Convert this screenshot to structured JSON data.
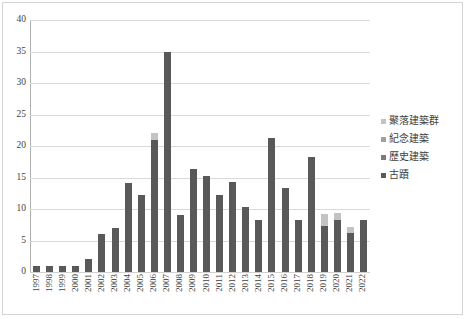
{
  "chart_data": {
    "type": "bar",
    "title": "",
    "subtitle": "",
    "xlabel": "",
    "ylabel": "",
    "ylim": [
      0,
      40
    ],
    "ytick_step": 5,
    "yticks": [
      "0",
      "5",
      "10",
      "15",
      "20",
      "25",
      "30",
      "35",
      "40"
    ],
    "grid": true,
    "stacked": true,
    "legend_position": "right",
    "categories": [
      "1997",
      "1998",
      "1999",
      "2000",
      "2001",
      "2002",
      "2003",
      "2004",
      "2005",
      "2006",
      "2007",
      "2008",
      "2009",
      "2010",
      "2011",
      "2012",
      "2013",
      "2014",
      "2015",
      "2016",
      "2017",
      "2018",
      "2019",
      "2020",
      "2021",
      "2022"
    ],
    "series": [
      {
        "name": "古蹟",
        "color": "#595959",
        "values": [
          1,
          1,
          1,
          1,
          2,
          6,
          7,
          14.2,
          12.2,
          21,
          35,
          9,
          16.3,
          15.3,
          12.3,
          14.3,
          10.3,
          8.3,
          21.3,
          13.3,
          8.3,
          18.3,
          7.3,
          8.3,
          6.2,
          8.3
        ]
      },
      {
        "name": "歷史建築",
        "color": "#7a7a7a",
        "values": [
          0,
          0,
          0,
          0,
          0,
          0,
          0,
          0,
          0,
          0,
          0,
          0,
          0,
          0,
          0,
          0,
          0,
          0,
          0,
          0,
          0,
          0,
          0,
          0,
          0,
          0
        ]
      },
      {
        "name": "紀念建築",
        "color": "#a0a0a0",
        "values": [
          0,
          0,
          0,
          0,
          0,
          0,
          0,
          0,
          0,
          0,
          0,
          0,
          0,
          0,
          0,
          0,
          0,
          0,
          0,
          0,
          0,
          0,
          0,
          0,
          0,
          0
        ]
      },
      {
        "name": "聚落建築群",
        "color": "#c3c3c3",
        "values": [
          0,
          0,
          0,
          0,
          0,
          0,
          0,
          0,
          0,
          1,
          0,
          0,
          0,
          0,
          0,
          0,
          0,
          0,
          0,
          0,
          0,
          0,
          1.9,
          1,
          1,
          0
        ]
      }
    ],
    "totals": [
      1,
      1,
      1,
      1,
      2,
      6,
      7,
      14.2,
      12.2,
      22,
      35,
      9,
      16.3,
      15.3,
      12.3,
      14.3,
      10.3,
      8.3,
      21.3,
      13.3,
      8.3,
      18.3,
      9.2,
      9.3,
      7.2,
      8.3
    ]
  },
  "legend": {
    "items": [
      {
        "label": "聚落建築群",
        "color": "#c3c3c3"
      },
      {
        "label": "紀念建築",
        "color": "#a0a0a0"
      },
      {
        "label": "歷史建築",
        "color": "#7a7a7a"
      },
      {
        "label": "古蹟",
        "color": "#595959"
      }
    ]
  }
}
